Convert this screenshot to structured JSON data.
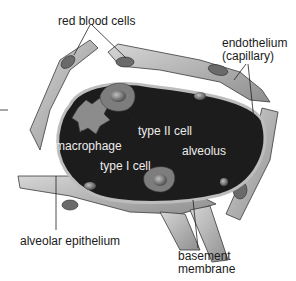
{
  "diagram": {
    "labels": {
      "red_blood_cells": "red blood cells",
      "endothelium_line1": "endothelium",
      "endothelium_line2": "(capillary)",
      "type_ii_cell": "type II cell",
      "macrophage": "macrophage",
      "alveolus": "alveolus",
      "type_i_cell": "type I cell",
      "alveolar_epithelium": "alveolar epithelium",
      "basement_line1": "basement",
      "basement_line2": "membrane"
    },
    "colors": {
      "lumen": "#1c1c1c",
      "tissue_light": "#c8c8c8",
      "tissue_mid": "#9a9a9a",
      "cell_dark": "#555555",
      "outline": "#3a3a3a",
      "text": "#1a1a1a",
      "text_inverse": "#ececec"
    }
  }
}
